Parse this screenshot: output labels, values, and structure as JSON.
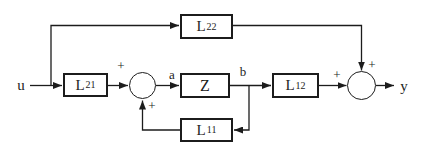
{
  "diagram": {
    "type": "block-diagram",
    "background_color": "#ffffff",
    "line_color": "#1c1c1c",
    "input_label": "u",
    "output_label": "y",
    "signal_labels": {
      "a": "a",
      "b": "b"
    },
    "blocks": {
      "l22": {
        "base": "L",
        "sub": "22"
      },
      "l21": {
        "base": "L",
        "sub": "21"
      },
      "z": {
        "label": "Z"
      },
      "l12": {
        "base": "L",
        "sub": "12"
      },
      "l11": {
        "base": "L",
        "sub": "11"
      }
    },
    "summing_junctions": {
      "sum1": {
        "sign_top": "+",
        "sign_bottom": "+"
      },
      "sum2": {
        "sign_left": "+",
        "sign_top": "+"
      }
    }
  }
}
